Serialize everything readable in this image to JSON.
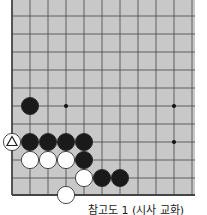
{
  "board": {
    "background": "#c8c8c8",
    "line_color": "#444444",
    "origin": {
      "x": 12,
      "y": 16
    },
    "spacing": 18,
    "cols": 11,
    "rows": 11,
    "edges": {
      "left": true,
      "bottom": true,
      "top": false,
      "right": false
    },
    "star_points": [
      [
        3,
        5
      ],
      [
        9,
        5
      ],
      [
        9,
        7
      ]
    ],
    "stones": [
      {
        "color": "black",
        "col": 1,
        "row": 5
      },
      {
        "color": "black",
        "col": 1,
        "row": 7
      },
      {
        "color": "black",
        "col": 2,
        "row": 7
      },
      {
        "color": "black",
        "col": 3,
        "row": 7
      },
      {
        "color": "black",
        "col": 4,
        "row": 7
      },
      {
        "color": "white",
        "col": 1,
        "row": 8
      },
      {
        "color": "white",
        "col": 2,
        "row": 8
      },
      {
        "color": "white",
        "col": 3,
        "row": 8
      },
      {
        "color": "black",
        "col": 4,
        "row": 8
      },
      {
        "color": "white",
        "col": 4,
        "row": 9
      },
      {
        "color": "black",
        "col": 5,
        "row": 9
      },
      {
        "color": "black",
        "col": 6,
        "row": 9
      },
      {
        "color": "white",
        "col": 3,
        "row": 10
      }
    ],
    "marked_stone": {
      "color": "white",
      "col": 0,
      "row": 7,
      "mark": "triangle"
    }
  },
  "caption": "참고도 1 (시사 교화)"
}
